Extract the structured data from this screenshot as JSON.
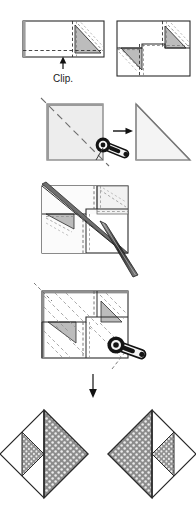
{
  "document": {
    "type": "origami-folding-instructions",
    "title": "Origami fold sequence diagram",
    "page_background": "#ffffff",
    "width": 196,
    "height": 526
  },
  "palette": {
    "line": "#2b2b2b",
    "line_light": "#8a8a8a",
    "paper_white": "#ffffff",
    "paper_gray": "#bcbcbc",
    "paper_gray_light": "#ededed",
    "dotted_fill_base": "#8c8c8c",
    "dotted_fill_dot": "#e8e8e8",
    "crease_dash": "#555555",
    "arrow": "#111111",
    "tool_dark": "#141414"
  },
  "labels": {
    "clip": "Clip."
  },
  "icons": {
    "clip_arrow": "arrow-up-icon",
    "progress_arrow": "arrow-right-icon",
    "result_arrow": "arrow-down-icon",
    "turn_tool": "rotate-turn-over-icon",
    "needle_tool": "needle-tool-icon"
  },
  "steps": [
    {
      "id": "step-1a",
      "index": 1,
      "name": "clipped-strip-front",
      "shape": "wide-rectangle",
      "description": "Wide rectangle strip with a shaded right-hand triangle flap and dashed crease lines",
      "has_shaded_triangle": true,
      "creases": [
        "horizontal-dashed",
        "vertical-dashed",
        "diagonal-dashed"
      ]
    },
    {
      "id": "step-1b",
      "index": 2,
      "name": "clipped-strip-both-ends",
      "shape": "rectangle",
      "description": "Rectangle with two shaded triangle flaps, one upper right and one lower left, with dashed creases",
      "has_shaded_triangle": true,
      "creases": [
        "horizontal-dashed",
        "vertical-dashed",
        "diagonal-dashed"
      ]
    },
    {
      "id": "step-2a",
      "index": 3,
      "name": "square-with-diagonal-crease",
      "shape": "square",
      "description": "Light gray square with a long dashed diagonal crease running corner to corner",
      "creases": [
        "diagonal-dashed"
      ]
    },
    {
      "id": "step-2b",
      "index": 4,
      "name": "folded-triangle",
      "shape": "right-triangle",
      "description": "Resulting right triangle after folding the square along the diagonal"
    },
    {
      "id": "step-3",
      "index": 5,
      "name": "assembled-square-with-needle",
      "shape": "square",
      "description": "Square assembly with internal panels, heavy diagonal band and a tapered needle tool inserted from lower right"
    },
    {
      "id": "step-4",
      "index": 6,
      "name": "square-with-dashed-fan-and-turn-tool",
      "shape": "square",
      "description": "Square with fan of parallel dashed creases, two shaded triangles and a turn-over tool symbol at lower right"
    },
    {
      "id": "step-5a",
      "index": 7,
      "name": "finished-diamond-left",
      "shape": "diamond",
      "description": "Finished diamond unit, patterned triangles filling right half and left-inner wedge"
    },
    {
      "id": "step-5b",
      "index": 8,
      "name": "finished-diamond-right",
      "shape": "diamond",
      "description": "Mirror image of the finished diamond unit, patterned triangles filling left half and right-inner wedge"
    }
  ]
}
